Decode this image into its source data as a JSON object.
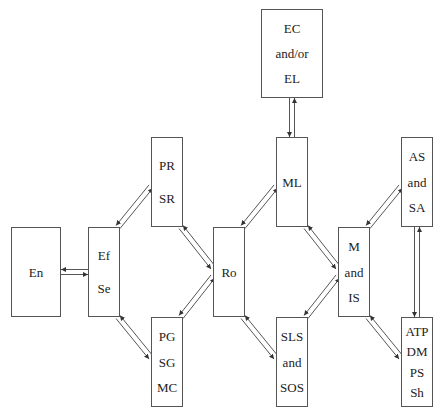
{
  "diagram": {
    "type": "bidirectional flow diagram",
    "nodes": [
      {
        "id": "en",
        "lines": [
          "En"
        ],
        "x": 11,
        "y": 227,
        "w": 50,
        "h": 90
      },
      {
        "id": "efse",
        "lines": [
          "Ef",
          "Se"
        ],
        "x": 88,
        "y": 227,
        "w": 32,
        "h": 90
      },
      {
        "id": "prsr",
        "lines": [
          "PR",
          "SR"
        ],
        "x": 151,
        "y": 137,
        "w": 32,
        "h": 90
      },
      {
        "id": "pgsg",
        "lines": [
          "PG",
          "SG",
          "MC"
        ],
        "x": 151,
        "y": 317,
        "w": 32,
        "h": 90
      },
      {
        "id": "ro",
        "lines": [
          "Ro"
        ],
        "x": 213,
        "y": 227,
        "w": 32,
        "h": 90
      },
      {
        "id": "ecel",
        "lines": [
          "EC",
          "and/or",
          "EL"
        ],
        "x": 261,
        "y": 9,
        "w": 62,
        "h": 89
      },
      {
        "id": "ml",
        "lines": [
          "ML"
        ],
        "x": 276,
        "y": 137,
        "w": 32,
        "h": 90
      },
      {
        "id": "sls",
        "lines": [
          "SLS",
          "and",
          "SOS"
        ],
        "x": 276,
        "y": 317,
        "w": 32,
        "h": 90
      },
      {
        "id": "mis",
        "lines": [
          "M",
          "and",
          "IS"
        ],
        "x": 338,
        "y": 227,
        "w": 32,
        "h": 90
      },
      {
        "id": "assa",
        "lines": [
          "AS",
          "and",
          "SA"
        ],
        "x": 401,
        "y": 137,
        "w": 32,
        "h": 90
      },
      {
        "id": "atp",
        "lines": [
          "ATP",
          "DM",
          "PS",
          "Sh"
        ],
        "x": 401,
        "y": 317,
        "w": 32,
        "h": 90
      }
    ],
    "edges": [
      {
        "from": "en",
        "to": "efse",
        "bidirectional": true
      },
      {
        "from": "efse",
        "to": "prsr",
        "bidirectional": true
      },
      {
        "from": "efse",
        "to": "pgsg",
        "bidirectional": true
      },
      {
        "from": "prsr",
        "to": "ro",
        "bidirectional": true
      },
      {
        "from": "pgsg",
        "to": "ro",
        "bidirectional": true
      },
      {
        "from": "ro",
        "to": "ml",
        "bidirectional": true
      },
      {
        "from": "ro",
        "to": "sls",
        "bidirectional": true
      },
      {
        "from": "ml",
        "to": "ecel",
        "bidirectional": true
      },
      {
        "from": "ml",
        "to": "mis",
        "bidirectional": true
      },
      {
        "from": "sls",
        "to": "mis",
        "bidirectional": true
      },
      {
        "from": "mis",
        "to": "assa",
        "bidirectional": true
      },
      {
        "from": "mis",
        "to": "atp",
        "bidirectional": true
      },
      {
        "from": "assa",
        "to": "atp",
        "bidirectional": true
      }
    ],
    "colors": {
      "stroke": "#555555",
      "text": "#222222",
      "background": "#ffffff"
    }
  }
}
